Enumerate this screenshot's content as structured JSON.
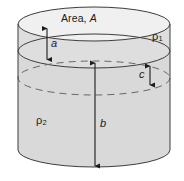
{
  "figure": {
    "type": "cylinder-two-fluid-layers",
    "labels": {
      "area_prefix": "Area, ",
      "area_symbol": "A",
      "rho_top_symbol": "ρ",
      "rho_top_sub": "1",
      "rho_bottom_symbol": "ρ",
      "rho_bottom_sub": "2",
      "dim_a": "a",
      "dim_b": "b",
      "dim_c": "c"
    },
    "colors": {
      "body_fill": "#d9d9d9",
      "top_face_fill": "#f2f2f2",
      "outline": "#3d3d3d",
      "dashed": "#6b6b6b",
      "arrow": "#1b1b1b",
      "text": "#1b1b1b",
      "background": "#ffffff"
    },
    "geometry": {
      "cx": 94,
      "rx": 76,
      "ry": 17,
      "top_ellipse_cy": 24,
      "mid_ellipse_cy": 51,
      "dashed_ellipse_cy": 78,
      "bottom_cy": 150
    }
  }
}
